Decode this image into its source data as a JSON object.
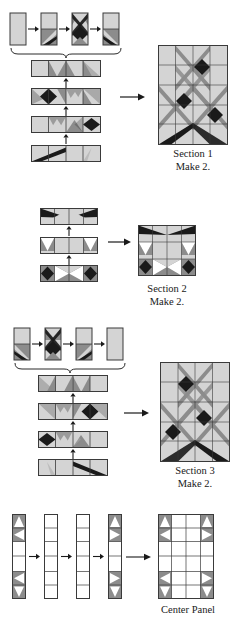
{
  "document": {
    "type": "quilt-assembly-diagram",
    "title": "Quilt Section Assembly Diagram",
    "palette": {
      "background": "#ffffff",
      "light": "#d4d4d4",
      "medium": "#8c8c8c",
      "dark": "#1a1a1a",
      "white": "#ffffff",
      "outline": "#3a3a3a",
      "arrow": "#1a1a1a",
      "text": "#202020"
    },
    "legend_codes": {
      "L": "light-gray-fabric",
      "M": "medium-gray-fabric",
      "D": "dark-black-fabric",
      "W": "white-fabric"
    }
  },
  "sections": [
    {
      "id": "section-1",
      "caption_line1": "Section 1",
      "caption_line2": "Make 2.",
      "unit_row": {
        "count": 4,
        "has_brace": true,
        "arrow_between": "right-arrow",
        "units": [
          {
            "name": "unit-plain-rectangle",
            "cells": [
              [
                "L"
              ],
              [
                "L"
              ]
            ]
          },
          {
            "name": "unit-corner-triangles",
            "cells": [
              [
                "L"
              ],
              [
                "MD"
              ]
            ]
          },
          {
            "name": "unit-star-diamond",
            "cells": [
              [
                "MX"
              ],
              [
                "DG"
              ]
            ]
          },
          {
            "name": "unit-reverse-triangles",
            "cells": [
              [
                "L"
              ],
              [
                "MR"
              ]
            ]
          }
        ]
      },
      "strips": [
        {
          "name": "strip-row-1",
          "cells": 4,
          "arrow": "up"
        },
        {
          "name": "strip-row-2",
          "cells": 4,
          "arrow": "up"
        },
        {
          "name": "strip-row-3",
          "cells": 4,
          "arrow": "up"
        },
        {
          "name": "strip-row-4",
          "cells": 4,
          "arrow": "none"
        }
      ],
      "result_block": {
        "name": "section-1-block",
        "columns": 4,
        "rows": 5
      }
    },
    {
      "id": "section-2",
      "caption_line1": "Section 2",
      "caption_line2": "Make 2.",
      "unit_row": {
        "count": 0,
        "has_brace": false
      },
      "strips": [
        {
          "name": "strip-row-1",
          "cells": 4,
          "arrow": "up"
        },
        {
          "name": "strip-row-2",
          "cells": 4,
          "arrow": "up"
        },
        {
          "name": "strip-row-3",
          "cells": 4,
          "arrow": "none"
        }
      ],
      "result_block": {
        "name": "section-2-block",
        "columns": 4,
        "rows": 3
      }
    },
    {
      "id": "section-3",
      "caption_line1": "Section 3",
      "caption_line2": "Make 2.",
      "unit_row": {
        "count": 4,
        "has_brace": true,
        "arrow_between": "right-arrow",
        "units": [
          {
            "name": "unit-reverse-triangles",
            "cells": [
              [
                "L"
              ],
              [
                "MR"
              ]
            ]
          },
          {
            "name": "unit-star-diamond",
            "cells": [
              [
                "MX"
              ],
              [
                "DG"
              ]
            ]
          },
          {
            "name": "unit-corner-triangles",
            "cells": [
              [
                "L"
              ],
              [
                "MD"
              ]
            ]
          },
          {
            "name": "unit-plain-rectangle",
            "cells": [
              [
                "L"
              ],
              [
                "L"
              ]
            ]
          }
        ]
      },
      "strips": [
        {
          "name": "strip-row-1",
          "cells": 4,
          "arrow": "up"
        },
        {
          "name": "strip-row-2",
          "cells": 4,
          "arrow": "up"
        },
        {
          "name": "strip-row-3",
          "cells": 4,
          "arrow": "up"
        },
        {
          "name": "strip-row-4",
          "cells": 4,
          "arrow": "none"
        }
      ],
      "result_block": {
        "name": "section-3-block",
        "columns": 4,
        "rows": 5
      }
    },
    {
      "id": "center-panel",
      "caption_line1": "Center Panel",
      "caption_line2": "",
      "columns_row": {
        "count": 4,
        "arrow_between": "right-arrow",
        "columns": [
          {
            "name": "column-pieced-left",
            "cells": 6,
            "pieced": true
          },
          {
            "name": "column-plain-1",
            "cells": 6,
            "pieced": false
          },
          {
            "name": "column-plain-2",
            "cells": 6,
            "pieced": false
          },
          {
            "name": "column-pieced-right",
            "cells": 6,
            "pieced": true
          }
        ]
      },
      "result_block": {
        "name": "center-panel-block",
        "columns": 4,
        "rows": 6
      }
    }
  ],
  "captions": {
    "section1_line1": "Section 1",
    "section1_line2": "Make 2.",
    "section2_line1": "Section 2",
    "section2_line2": "Make 2.",
    "section3_line1": "Section 3",
    "section3_line2": "Make 2.",
    "center_line1": "Center Panel"
  },
  "arrows": {
    "right": "right-arrow-icon",
    "up": "up-arrow-icon",
    "brace": "curly-brace"
  }
}
